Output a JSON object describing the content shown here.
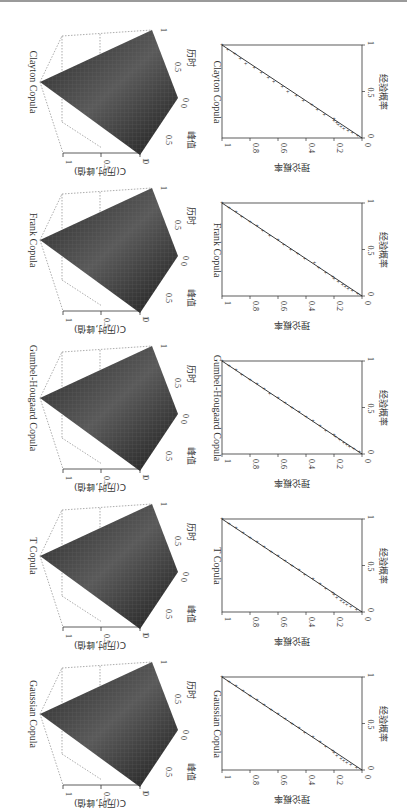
{
  "figure": {
    "orientation": "rotated 90 degrees clockwise",
    "layout": "5 rows x 2 columns; left column = 3D copula CDF surfaces, right column = P-P plots",
    "panels_3d_labels": {
      "x_axis": "历时",
      "y_axis": "峰值",
      "z_axis": "C(历时,峰值)",
      "x_ticks": [
        "0",
        "0.5",
        "1"
      ],
      "y_ticks": [
        "0",
        "0.5",
        "1"
      ],
      "z_ticks": [
        "0",
        "0.5",
        "1"
      ]
    },
    "panels_pp_labels": {
      "x_axis": "经验概率",
      "y_axis": "理论概率",
      "x_ticks": [
        "0",
        "0.5",
        "1"
      ],
      "y_ticks": [
        "0",
        "0.2",
        "0.4",
        "0.6",
        "0.8",
        "1"
      ]
    },
    "rows": [
      {
        "title": "Clayton Copula"
      },
      {
        "title": "Frank Copula"
      },
      {
        "title": "Gumbel-Hougaard Copula"
      },
      {
        "title": "T Copula"
      },
      {
        "title": "Gaussian Copula"
      }
    ]
  },
  "chart_data": [
    {
      "type": "surface",
      "title": "Clayton Copula",
      "xlabel": "历时",
      "ylabel": "峰值",
      "zlabel": "C(历时,峰值)",
      "xlim": [
        0,
        1
      ],
      "ylim": [
        0,
        1
      ],
      "zlim": [
        0,
        1
      ]
    },
    {
      "type": "scatter",
      "title": "Clayton Copula",
      "xlabel": "经验概率",
      "ylabel": "理论概率",
      "xlim": [
        0,
        1
      ],
      "ylim": [
        0,
        1
      ],
      "reference_line": [
        [
          0,
          0
        ],
        [
          1,
          1
        ]
      ],
      "points": [
        [
          0.02,
          0.03
        ],
        [
          0.05,
          0.07
        ],
        [
          0.08,
          0.1
        ],
        [
          0.1,
          0.13
        ],
        [
          0.12,
          0.15
        ],
        [
          0.14,
          0.17
        ],
        [
          0.16,
          0.18
        ],
        [
          0.18,
          0.2
        ],
        [
          0.2,
          0.2
        ],
        [
          0.25,
          0.27
        ],
        [
          0.3,
          0.32
        ],
        [
          0.35,
          0.36
        ],
        [
          0.4,
          0.42
        ],
        [
          0.45,
          0.47
        ],
        [
          0.5,
          0.53
        ],
        [
          0.55,
          0.57
        ],
        [
          0.6,
          0.63
        ],
        [
          0.65,
          0.67
        ],
        [
          0.7,
          0.72
        ],
        [
          0.75,
          0.77
        ],
        [
          0.8,
          0.83
        ],
        [
          0.85,
          0.87
        ],
        [
          0.9,
          0.91
        ],
        [
          0.95,
          0.96
        ],
        [
          1.0,
          1.0
        ]
      ]
    },
    {
      "type": "surface",
      "title": "Frank Copula",
      "xlabel": "历时",
      "ylabel": "峰值",
      "zlabel": "C(历时,峰值)",
      "xlim": [
        0,
        1
      ],
      "ylim": [
        0,
        1
      ],
      "zlim": [
        0,
        1
      ]
    },
    {
      "type": "scatter",
      "title": "Frank Copula",
      "xlabel": "经验概率",
      "ylabel": "理论概率",
      "xlim": [
        0,
        1
      ],
      "ylim": [
        0,
        1
      ],
      "reference_line": [
        [
          0,
          0
        ],
        [
          1,
          1
        ]
      ],
      "points": [
        [
          0.02,
          0.03
        ],
        [
          0.05,
          0.07
        ],
        [
          0.08,
          0.1
        ],
        [
          0.1,
          0.12
        ],
        [
          0.12,
          0.14
        ],
        [
          0.15,
          0.17
        ],
        [
          0.18,
          0.2
        ],
        [
          0.2,
          0.21
        ],
        [
          0.25,
          0.26
        ],
        [
          0.3,
          0.31
        ],
        [
          0.35,
          0.34
        ],
        [
          0.4,
          0.41
        ],
        [
          0.45,
          0.46
        ],
        [
          0.5,
          0.51
        ],
        [
          0.55,
          0.56
        ],
        [
          0.6,
          0.6
        ],
        [
          0.65,
          0.66
        ],
        [
          0.7,
          0.71
        ],
        [
          0.75,
          0.75
        ],
        [
          0.8,
          0.8
        ],
        [
          0.85,
          0.86
        ],
        [
          0.9,
          0.9
        ],
        [
          0.95,
          0.95
        ],
        [
          1.0,
          1.0
        ]
      ]
    },
    {
      "type": "surface",
      "title": "Gumbel-Hougaard Copula",
      "xlabel": "历时",
      "ylabel": "峰值",
      "zlabel": "C(历时,峰值)",
      "xlim": [
        0,
        1
      ],
      "ylim": [
        0,
        1
      ],
      "zlim": [
        0,
        1
      ]
    },
    {
      "type": "scatter",
      "title": "Gumbel-Hougaard Copula",
      "xlabel": "经验概率",
      "ylabel": "理论概率",
      "xlim": [
        0,
        1
      ],
      "ylim": [
        0,
        1
      ],
      "reference_line": [
        [
          0,
          0
        ],
        [
          1,
          1
        ]
      ],
      "points": [
        [
          0.02,
          0.02
        ],
        [
          0.05,
          0.06
        ],
        [
          0.08,
          0.09
        ],
        [
          0.1,
          0.11
        ],
        [
          0.12,
          0.13
        ],
        [
          0.15,
          0.16
        ],
        [
          0.18,
          0.19
        ],
        [
          0.2,
          0.2
        ],
        [
          0.25,
          0.26
        ],
        [
          0.3,
          0.3
        ],
        [
          0.35,
          0.35
        ],
        [
          0.4,
          0.4
        ],
        [
          0.45,
          0.45
        ],
        [
          0.5,
          0.5
        ],
        [
          0.55,
          0.55
        ],
        [
          0.6,
          0.6
        ],
        [
          0.65,
          0.66
        ],
        [
          0.7,
          0.7
        ],
        [
          0.75,
          0.75
        ],
        [
          0.8,
          0.8
        ],
        [
          0.85,
          0.86
        ],
        [
          0.9,
          0.9
        ],
        [
          0.95,
          0.95
        ],
        [
          1.0,
          1.0
        ]
      ]
    },
    {
      "type": "surface",
      "title": "T Copula",
      "xlabel": "历时",
      "ylabel": "峰值",
      "zlabel": "C(历时,峰值)",
      "xlim": [
        0,
        1
      ],
      "ylim": [
        0,
        1
      ],
      "zlim": [
        0,
        1
      ]
    },
    {
      "type": "scatter",
      "title": "T Copula",
      "xlabel": "经验概率",
      "ylabel": "理论概率",
      "xlim": [
        0,
        1
      ],
      "ylim": [
        0,
        1
      ],
      "reference_line": [
        [
          0,
          0
        ],
        [
          1,
          1
        ]
      ],
      "points": [
        [
          0.02,
          0.04
        ],
        [
          0.05,
          0.08
        ],
        [
          0.08,
          0.11
        ],
        [
          0.1,
          0.13
        ],
        [
          0.12,
          0.15
        ],
        [
          0.15,
          0.18
        ],
        [
          0.18,
          0.2
        ],
        [
          0.2,
          0.21
        ],
        [
          0.25,
          0.26
        ],
        [
          0.3,
          0.3
        ],
        [
          0.35,
          0.35
        ],
        [
          0.4,
          0.41
        ],
        [
          0.45,
          0.45
        ],
        [
          0.5,
          0.5
        ],
        [
          0.55,
          0.55
        ],
        [
          0.6,
          0.6
        ],
        [
          0.65,
          0.65
        ],
        [
          0.7,
          0.7
        ],
        [
          0.75,
          0.75
        ],
        [
          0.8,
          0.8
        ],
        [
          0.85,
          0.85
        ],
        [
          0.9,
          0.9
        ],
        [
          0.95,
          0.95
        ],
        [
          1.0,
          1.0
        ]
      ]
    },
    {
      "type": "surface",
      "title": "Gaussian Copula",
      "xlabel": "历时",
      "ylabel": "峰值",
      "zlabel": "C(历时,峰值)",
      "xlim": [
        0,
        1
      ],
      "ylim": [
        0,
        1
      ],
      "zlim": [
        0,
        1
      ]
    },
    {
      "type": "scatter",
      "title": "Gaussian Copula",
      "xlabel": "经验概率",
      "ylabel": "理论概率",
      "xlim": [
        0,
        1
      ],
      "ylim": [
        0,
        1
      ],
      "reference_line": [
        [
          0,
          0
        ],
        [
          1,
          1
        ]
      ],
      "points": [
        [
          0.02,
          0.04
        ],
        [
          0.05,
          0.08
        ],
        [
          0.08,
          0.11
        ],
        [
          0.1,
          0.13
        ],
        [
          0.12,
          0.15
        ],
        [
          0.15,
          0.18
        ],
        [
          0.18,
          0.2
        ],
        [
          0.2,
          0.21
        ],
        [
          0.25,
          0.26
        ],
        [
          0.3,
          0.3
        ],
        [
          0.35,
          0.35
        ],
        [
          0.4,
          0.41
        ],
        [
          0.45,
          0.45
        ],
        [
          0.5,
          0.5
        ],
        [
          0.55,
          0.55
        ],
        [
          0.6,
          0.6
        ],
        [
          0.65,
          0.65
        ],
        [
          0.7,
          0.7
        ],
        [
          0.75,
          0.75
        ],
        [
          0.8,
          0.8
        ],
        [
          0.85,
          0.85
        ],
        [
          0.9,
          0.9
        ],
        [
          0.95,
          0.95
        ],
        [
          1.0,
          1.0
        ]
      ]
    }
  ]
}
